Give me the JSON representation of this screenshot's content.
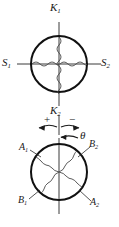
{
  "figure": {
    "type": "technical-diagram",
    "background_color": "#ffffff",
    "line_color": "#1a1a1a"
  },
  "upper_diagram": {
    "axis_vertical_top_label": "K",
    "axis_vertical_top_sub": "1",
    "axis_vertical_bottom_label": "K",
    "axis_vertical_bottom_sub": "2",
    "axis_horizontal_left_label": "S",
    "axis_horizontal_left_sub": "1",
    "axis_horizontal_right_label": "S",
    "axis_horizontal_right_sub": "2",
    "circle": {
      "cx": 59,
      "cy": 64,
      "r": 28
    }
  },
  "rotation_indicator": {
    "plus_sign": "+",
    "minus_sign": "−",
    "angle_label": "θ"
  },
  "lower_diagram": {
    "label_upper_left": "A",
    "label_upper_left_sub": "1",
    "label_upper_right": "B",
    "label_upper_right_sub": "2",
    "label_lower_left": "B",
    "label_lower_left_sub": "1",
    "label_lower_right": "A",
    "label_lower_right_sub": "2",
    "circle": {
      "cx": 59,
      "cy": 172,
      "r": 28
    }
  }
}
